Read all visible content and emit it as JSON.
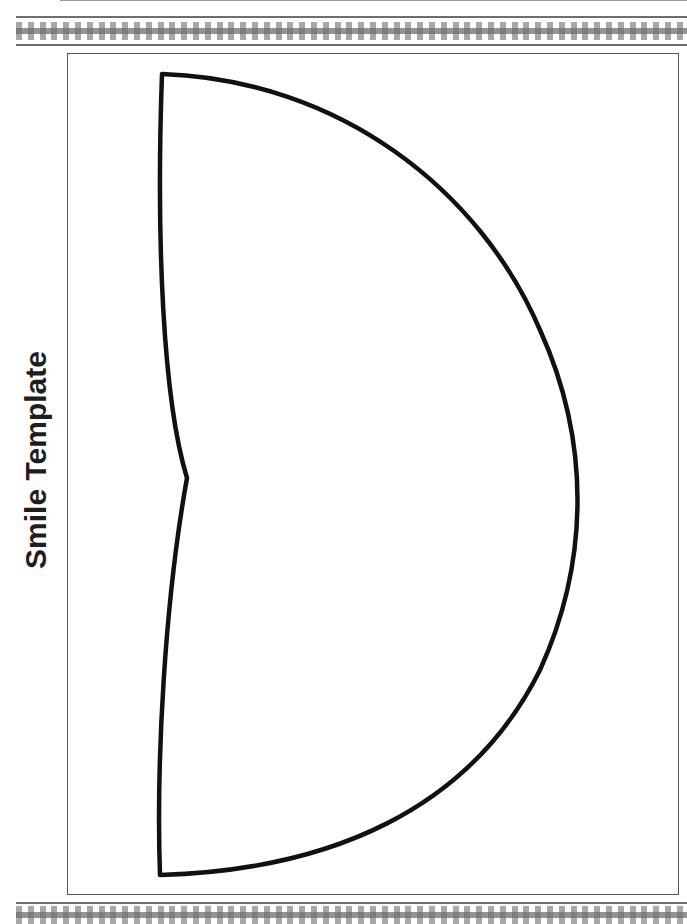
{
  "page": {
    "title": "Smile Template",
    "colors": {
      "outline": "#111111",
      "frame": "#555555",
      "checker_light": "#a8a8a8",
      "checker_dark": "#6e6e6e",
      "background": "#ffffff"
    }
  },
  "shape": {
    "name": "smile-mouth-outline",
    "description": "Half-circle mouth shape with a notch at the center of the flat edge"
  }
}
